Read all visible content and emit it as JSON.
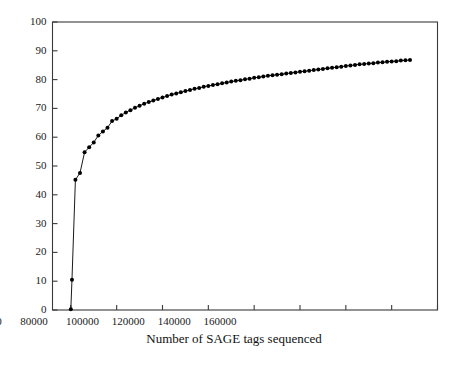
{
  "chart_data": {
    "type": "line",
    "title": "",
    "subtitle": "",
    "xlabel": "Number of SAGE tags sequenced",
    "ylabel": "",
    "xlim": [
      -8000,
      160000
    ],
    "ylim": [
      0,
      100
    ],
    "xticks": [
      0,
      20000,
      40000,
      60000,
      80000,
      100000,
      120000,
      140000,
      160000
    ],
    "xtick_labels": [
      "0",
      "20000",
      "40000",
      "60000",
      "80000",
      "100000",
      "120000",
      "140000",
      "160000"
    ],
    "yticks": [
      0,
      10,
      20,
      30,
      40,
      50,
      60,
      70,
      80,
      90,
      100
    ],
    "ytick_labels": [
      "0",
      "10",
      "20",
      "30",
      "40",
      "50",
      "60",
      "70",
      "80",
      "90",
      "100"
    ],
    "grid": false,
    "legend": null,
    "marker": "filled-circle",
    "marker_color": "#000000",
    "line_color": "#000000",
    "series": [
      {
        "name": "Percentage of unique SAGE tags detected",
        "x": [
          0,
          500,
          2000,
          4000,
          6000,
          8000,
          10000,
          12000,
          14000,
          16000,
          18000,
          20000,
          22000,
          24000,
          26000,
          28000,
          30000,
          32000,
          34000,
          36000,
          38000,
          40000,
          42000,
          44000,
          46000,
          48000,
          50000,
          52000,
          54000,
          56000,
          58000,
          60000,
          62000,
          64000,
          66000,
          68000,
          70000,
          72000,
          74000,
          76000,
          78000,
          80000,
          82000,
          84000,
          86000,
          88000,
          90000,
          92000,
          94000,
          96000,
          98000,
          100000,
          102000,
          104000,
          106000,
          108000,
          110000,
          112000,
          114000,
          116000,
          118000,
          120000,
          122000,
          124000,
          126000,
          128000,
          130000,
          132000,
          134000,
          136000,
          138000,
          140000,
          142000,
          144000,
          146000,
          148000
        ],
        "y": [
          0.3,
          10.5,
          45.2,
          47.6,
          54.8,
          56.5,
          58.2,
          60.6,
          62.0,
          63.3,
          65.6,
          66.4,
          67.6,
          68.6,
          69.4,
          70.2,
          70.9,
          71.6,
          72.2,
          72.7,
          73.3,
          73.8,
          74.3,
          74.8,
          75.2,
          75.6,
          76.0,
          76.4,
          76.8,
          77.1,
          77.5,
          77.8,
          78.1,
          78.4,
          78.7,
          79.0,
          79.3,
          79.6,
          79.8,
          80.1,
          80.3,
          80.6,
          80.8,
          81.1,
          81.3,
          81.5,
          81.7,
          81.9,
          82.1,
          82.3,
          82.5,
          82.7,
          82.9,
          83.1,
          83.3,
          83.5,
          83.7,
          83.9,
          84.1,
          84.3,
          84.5,
          84.7,
          84.9,
          85.1,
          85.3,
          85.4,
          85.6,
          85.7,
          85.9,
          86.0,
          86.2,
          86.3,
          86.4,
          86.6,
          86.7,
          86.8
        ]
      }
    ]
  },
  "axis": {
    "frame_color": "#3a3a3a"
  }
}
